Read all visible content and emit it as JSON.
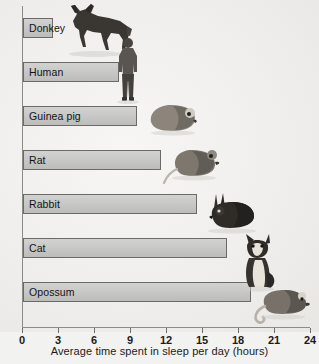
{
  "chart_data": {
    "type": "bar",
    "orientation": "horizontal",
    "title": "",
    "xlabel": "Average time spent in sleep per day  (hours)",
    "ylabel": "",
    "xlim": [
      0,
      24
    ],
    "xticks": [
      0,
      3,
      6,
      9,
      12,
      15,
      18,
      21,
      24
    ],
    "xtick_labels": [
      "0",
      "3",
      "6",
      "9",
      "12",
      "15",
      "18",
      "21",
      "24"
    ],
    "grid": false,
    "legend": "none",
    "categories": [
      "Donkey",
      "Human",
      "Guinea pig",
      "Rat",
      "Rabbit",
      "Cat",
      "Opossum"
    ],
    "values": [
      2.5,
      8,
      9.5,
      11.5,
      14.5,
      17,
      19
    ],
    "bar_fill": "#c6c6c4",
    "bar_stroke": "#6a6a68",
    "background": "#efeeec"
  },
  "axis": {
    "x_title": "Average time spent in sleep per day  (hours)",
    "ticks": [
      {
        "value": 0,
        "label": "0"
      },
      {
        "value": 3,
        "label": "3"
      },
      {
        "value": 6,
        "label": "6"
      },
      {
        "value": 9,
        "label": "9"
      },
      {
        "value": 12,
        "label": "12"
      },
      {
        "value": 15,
        "label": "15"
      },
      {
        "value": 18,
        "label": "18"
      },
      {
        "value": 21,
        "label": "21"
      },
      {
        "value": 24,
        "label": "24"
      }
    ]
  },
  "bars": [
    {
      "label": "Donkey",
      "value": 2.5,
      "icon": "donkey-illustration"
    },
    {
      "label": "Human",
      "value": 8,
      "icon": "human-illustration"
    },
    {
      "label": "Guinea pig",
      "value": 9.5,
      "icon": "guinea-pig-illustration"
    },
    {
      "label": "Rat",
      "value": 11.5,
      "icon": "rat-illustration"
    },
    {
      "label": "Rabbit",
      "value": 14.5,
      "icon": "rabbit-illustration"
    },
    {
      "label": "Cat",
      "value": 17,
      "icon": "cat-illustration"
    },
    {
      "label": "Opossum",
      "value": 19,
      "icon": "opossum-illustration"
    }
  ]
}
